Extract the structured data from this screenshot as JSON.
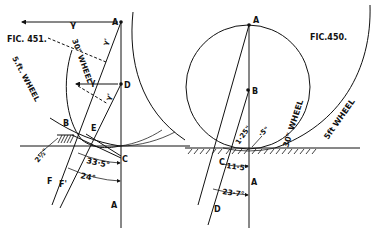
{
  "figures": {
    "fig451": {
      "title": "FIC. 451.",
      "labels": {
        "A_top": "A",
        "D": "D",
        "B": "B",
        "E": "E",
        "C": "C",
        "F": "F",
        "F1": "F'",
        "A_bottom": "A",
        "gamma_top": "γ",
        "gamma_mid": "γ",
        "gamma_prime_top": "γ'",
        "gamma_prime_mid": "γ'",
        "wheel_30": "30\" WHEEL",
        "wheel_5ft": "5.ft. WHEEL",
        "offset": "2½\"",
        "angle_large": "33·5°",
        "angle_small": "24°"
      }
    },
    "fig450": {
      "title": "FIC.450.",
      "labels": {
        "A_top": "A",
        "B": "B",
        "C": "C",
        "D": "D",
        "A_bottom": "A",
        "wheel_30": "30\" WHEEL",
        "wheel_5ft": "5ft WHEEL",
        "depth_125": "1·25\"",
        "depth_5": "·5\"",
        "angle_small": "11·5°",
        "angle_large": "23·7°"
      }
    }
  },
  "colors": {
    "ink": "#111111",
    "paper": "#ffffff"
  }
}
